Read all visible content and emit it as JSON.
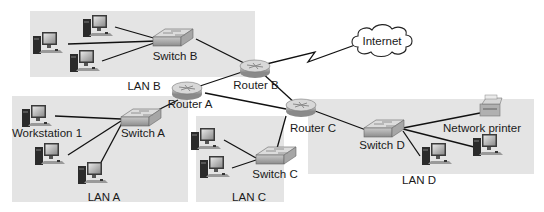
{
  "diagram": {
    "type": "network-topology",
    "colors": {
      "lan_background": "#e4e4e4",
      "link": "#111111",
      "device_body": "#b9b9b9",
      "text": "#1a1a1a"
    },
    "lans": [
      {
        "id": "lanB",
        "label": "LAN B"
      },
      {
        "id": "lanA",
        "label": "LAN A"
      },
      {
        "id": "lanC",
        "label": "LAN C"
      },
      {
        "id": "lanD",
        "label": "LAN D"
      }
    ],
    "routers": [
      {
        "id": "routerA",
        "label": "Router A"
      },
      {
        "id": "routerB",
        "label": "Router B"
      },
      {
        "id": "routerC",
        "label": "Router C"
      }
    ],
    "switches": [
      {
        "id": "switchA",
        "label": "Switch A"
      },
      {
        "id": "switchB",
        "label": "Switch B"
      },
      {
        "id": "switchC",
        "label": "Switch C"
      },
      {
        "id": "switchD",
        "label": "Switch D"
      }
    ],
    "internet": {
      "label": "Internet"
    },
    "workstation_label": "Workstation 1",
    "printer_label": "Network printer",
    "links": [
      [
        "routerB",
        "internet"
      ],
      [
        "routerA",
        "routerB"
      ],
      [
        "routerB",
        "routerC"
      ],
      [
        "routerA",
        "routerC"
      ],
      [
        "routerA",
        "switchA"
      ],
      [
        "routerB",
        "switchB"
      ],
      [
        "routerC",
        "switchC"
      ],
      [
        "routerC",
        "switchD"
      ]
    ]
  }
}
